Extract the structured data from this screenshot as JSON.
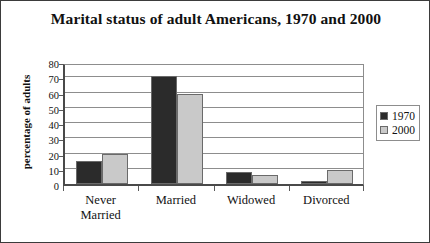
{
  "chart_data": {
    "type": "bar",
    "title": "Marital status of adult Americans, 1970 and 2000",
    "xlabel": "",
    "ylabel": "percentage of adults",
    "categories": [
      "Never Married",
      "Married",
      "Widowed",
      "Divorced"
    ],
    "category_lines": [
      [
        "Never",
        "Married"
      ],
      [
        "Married"
      ],
      [
        "Widowed"
      ],
      [
        "Divorced"
      ]
    ],
    "series": [
      {
        "name": "1970",
        "color": "#2b2b2b",
        "values": [
          15,
          71,
          8,
          2
        ]
      },
      {
        "name": "2000",
        "color": "#c9c9c9",
        "values": [
          20,
          59,
          6,
          9
        ]
      }
    ],
    "ylim": [
      0,
      80
    ],
    "ytick_step": 10,
    "yticks": [
      80,
      70,
      60,
      50,
      40,
      30,
      20,
      10,
      0
    ],
    "grid": true,
    "legend_position": "right",
    "legend_entries": [
      "1970",
      "2000"
    ]
  },
  "colors": {
    "series_1970": "#2b2b2b",
    "series_2000": "#c9c9c9",
    "axis": "#4a4a4a",
    "grid": "#8d8d8d",
    "frame": "#3b3b3b",
    "text": "#111111",
    "background": "#ffffff"
  }
}
